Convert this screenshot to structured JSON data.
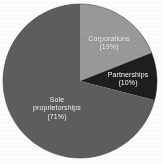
{
  "chart_data": {
    "type": "pie",
    "title": "",
    "subtitle": "",
    "xlabel": "",
    "ylabel": "",
    "legend_position": "none",
    "grid": false,
    "labels_inside_slices": true,
    "start_angle_deg": 0,
    "direction": "clockwise",
    "categories": [
      "Corporations",
      "Partnerships",
      "Sole proprietorships"
    ],
    "values": [
      19,
      10,
      71
    ],
    "unit": "%",
    "slices": [
      {
        "name": "Corporations",
        "value": 19,
        "label": "Corporations",
        "pct_label": "(19%)",
        "color": "#9a9a9a",
        "text_color": "#ffffff",
        "start_deg": 0,
        "end_deg": 68.4
      },
      {
        "name": "Partnerships",
        "value": 10,
        "label": "Partnerships",
        "pct_label": "(10%)",
        "color": "#1e1e1e",
        "text_color": "#ffffff",
        "start_deg": 68.4,
        "end_deg": 104.4
      },
      {
        "name": "Sole proprietorships",
        "value": 71,
        "label_line1": "Sole",
        "label_line2": "proprietorships",
        "pct_label": "(71%)",
        "color": "#5e5e5e",
        "text_color": "#ffffff",
        "start_deg": 104.4,
        "end_deg": 360
      }
    ]
  },
  "figure": {
    "background": "#ffffff",
    "center_x": 80,
    "center_y": 81,
    "radius": 77
  }
}
